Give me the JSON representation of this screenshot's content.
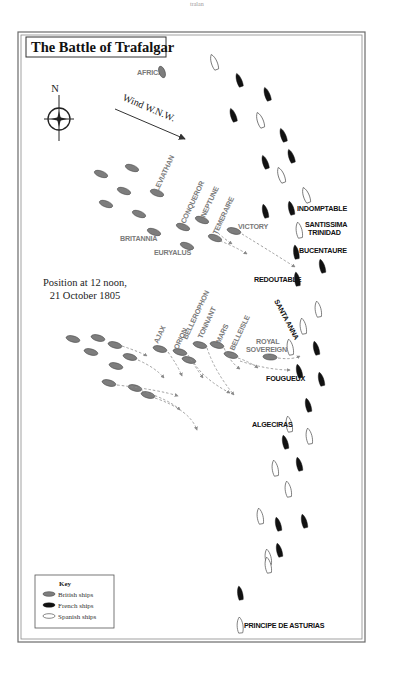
{
  "page": {
    "header_fragment": "tralan"
  },
  "map": {
    "title": "The Battle of Trafalgar",
    "caption_line1": "Position at 12 noon,",
    "caption_line2": "21 October 1805",
    "compass_label": "N",
    "wind_label": "Wind W.N.W.",
    "landmark": "AFRICA",
    "colors": {
      "british": "#7d7d7d",
      "french": "#111111",
      "spanish": "#ffffff",
      "track": "#8a8a8a",
      "frame": "#6b6b6b"
    },
    "key": {
      "title": "Key",
      "items": [
        {
          "label": "British ships",
          "type": "british"
        },
        {
          "label": "French ships",
          "type": "french"
        },
        {
          "label": "Spanish ships",
          "type": "spanish"
        }
      ]
    },
    "british_labels": {
      "leviathan": "LEVIATHAN",
      "conqueror": "CONQUEROR",
      "neptune": "NEPTUNE",
      "temeraire": "TEMERAIRE",
      "victory": "VICTORY",
      "britannia": "BRITANNIA",
      "euryalus": "EURYALUS",
      "ajax": "AJAX",
      "orion": "ORION",
      "bellerophon": "BELLEROPHON",
      "tonnant": "TONNANT",
      "mars": "MARS",
      "belleisle": "BELLEISLE",
      "royal_sovereign_1": "ROYAL",
      "royal_sovereign_2": "SOVEREIGN"
    },
    "enemy_labels": {
      "indomptable": "INDOMPTABLE",
      "santissima_1": "SANTISSIMA",
      "santissima_2": "TRINIDAD",
      "bucentaure": "BUCENTAURE",
      "redoutable": "REDOUTABLE",
      "santa_anna": "SANTA ANNA",
      "fougueux": "FOUGUEUX",
      "algeciras": "ALGECIRAS",
      "principe": "PRINCIPE DE ASTURIAS"
    }
  }
}
